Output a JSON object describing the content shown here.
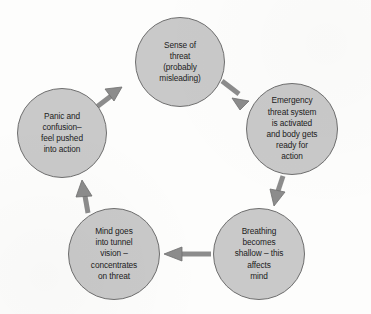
{
  "diagram": {
    "type": "cycle-flowchart",
    "direction": "clockwise",
    "background_color": "#fdfdfc",
    "node_fill_color": "#c9c9c9",
    "node_border_color": "#6f6f6f",
    "arrow_color": "#8c8c8c",
    "text_color": "#1c1c1c",
    "nodes": [
      {
        "id": "sense-of-threat",
        "label": "Sense of\nthreat\n(probably\nmisleading)",
        "cx": 180,
        "cy": 62,
        "r": 45
      },
      {
        "id": "emergency-threat-system",
        "label": "Emergency\nthreat system\nis activated\nand body gets\nready for\naction",
        "cx": 292,
        "cy": 129,
        "r": 46
      },
      {
        "id": "breathing-becomes-shallow",
        "label": "Breathing\nbecomes\nshallow – this\naffects\nmind",
        "cx": 259,
        "cy": 254,
        "r": 46
      },
      {
        "id": "mind-goes-into-tunnel-vision",
        "label": "Mind goes\ninto tunnel\nvision –\nconcentrates\non threat",
        "cx": 114,
        "cy": 254,
        "r": 46
      },
      {
        "id": "panic-and-confusion",
        "label": "Panic and\nconfusion–\nfeel pushed\ninto action",
        "cx": 62,
        "cy": 133,
        "r": 45
      }
    ],
    "arrows": [
      {
        "id": "arrow-panic-to-sense",
        "from": "panic-and-confusion",
        "to": "sense-of-threat"
      },
      {
        "id": "arrow-sense-to-emergency",
        "from": "sense-of-threat",
        "to": "emergency-threat-system"
      },
      {
        "id": "arrow-emergency-to-breathing",
        "from": "emergency-threat-system",
        "to": "breathing-becomes-shallow"
      },
      {
        "id": "arrow-breathing-to-mind",
        "from": "breathing-becomes-shallow",
        "to": "mind-goes-into-tunnel-vision"
      },
      {
        "id": "arrow-mind-to-panic",
        "from": "mind-goes-into-tunnel-vision",
        "to": "panic-and-confusion"
      }
    ]
  }
}
